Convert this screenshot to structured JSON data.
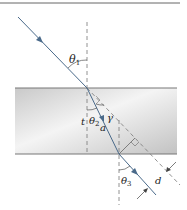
{
  "diagram": {
    "type": "refraction-through-slab",
    "labels": {
      "theta1": "θ",
      "theta1_sub": "1",
      "theta2": "θ",
      "theta2_sub": "2",
      "theta3": "θ",
      "theta3_sub": "3",
      "gamma": "γ",
      "a": "a",
      "t": "t",
      "d": "d"
    },
    "colors": {
      "ray": "#4a6a8a",
      "dashed": "#777777",
      "slab_light": "#f2f2f2",
      "slab_dark": "#c4c4c4",
      "slab_edge": "#888888",
      "rule": "#666666"
    }
  }
}
